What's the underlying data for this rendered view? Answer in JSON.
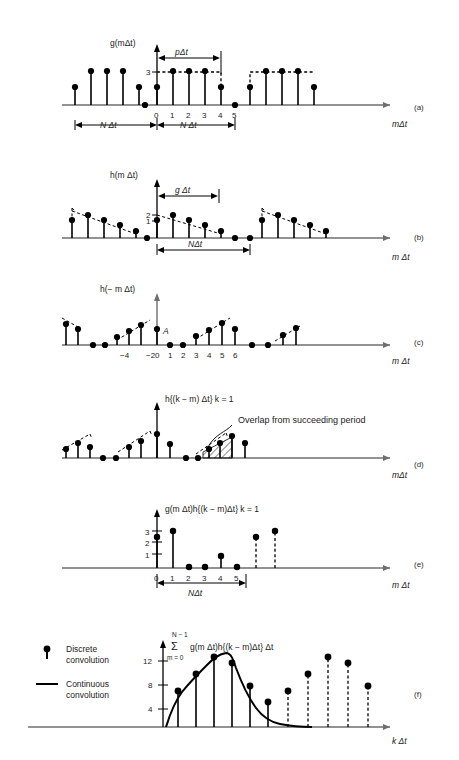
{
  "figure": {
    "title_implied": "Discrete convolution of periodic sequences",
    "panel_labels": [
      "(a)",
      "(b)",
      "(c)",
      "(d)",
      "(e)",
      "(f)"
    ],
    "colors": {
      "ink": "#000000",
      "axis": "#6e6e6e",
      "background": "#ffffff"
    }
  },
  "panels": {
    "a": {
      "label": "(a)",
      "function_label": "g(mΔt)",
      "x_axis_label": "mΔt",
      "y_ticks": [
        "3"
      ],
      "x_ticks": [
        "0",
        "1",
        "2",
        "3",
        "4",
        "5"
      ],
      "brackets": [
        "pΔt",
        "N Δt",
        "N Δt"
      ],
      "series_values": [
        1,
        3,
        3,
        3,
        1,
        0
      ],
      "series_x": [
        0,
        1,
        2,
        3,
        4,
        5
      ]
    },
    "b": {
      "label": "(b)",
      "function_label": "h(m Δt)",
      "x_axis_label": "m Δt",
      "y_ticks": [
        "2",
        "1"
      ],
      "brackets": [
        "g Δt",
        "NΔt"
      ],
      "series_values": [
        2,
        1.75,
        1.45,
        1.15,
        0.85,
        0.5,
        0.15,
        0,
        0
      ],
      "series_x": [
        0,
        1,
        2,
        3,
        4,
        5,
        6,
        7,
        8
      ]
    },
    "c": {
      "label": "(c)",
      "function_label": "h(− m Δt)",
      "x_axis_label": "m Δt",
      "point_label": "A",
      "x_ticks": [
        "−4",
        "−2",
        "0",
        "1",
        "2",
        "3",
        "4",
        "5",
        "6"
      ],
      "series_values": [
        0,
        0,
        0.35,
        0.7,
        1.05,
        1.4,
        1.75,
        2.0,
        0.15,
        0
      ],
      "series_x": [
        -5,
        -4,
        -3,
        -2,
        -1,
        0,
        1,
        2,
        3,
        4
      ]
    },
    "d": {
      "label": "(d)",
      "function_label": "h{(k − m) Δt} k = 1",
      "x_axis_label": "mΔt",
      "annotation": "Overlap from succeeding period",
      "series_values": [
        0.4,
        0.75,
        1.1,
        1.45,
        1.8,
        2.1,
        0.9,
        0
      ],
      "series_x": [
        0,
        1,
        2,
        3,
        4,
        5,
        6,
        7
      ]
    },
    "e": {
      "label": "(e)",
      "function_label": "g(m Δt)h{(k − m)Δt} k = 1",
      "x_axis_label": "m Δt",
      "y_ticks": [
        "3",
        "2",
        "1"
      ],
      "x_ticks": [
        "0",
        "1",
        "2",
        "3",
        "4",
        "5"
      ],
      "brackets": [
        "NΔt"
      ],
      "series_values": [
        2.2,
        3.0,
        0.12,
        0.12,
        0.95,
        0.1
      ],
      "series_x": [
        0,
        1,
        2,
        3,
        4,
        5
      ],
      "repeat_values": [
        2.2,
        3.0
      ]
    },
    "f": {
      "label": "(f)",
      "function_label_sum": "Σ",
      "function_label_upper": "N − 1",
      "function_label_lower": "m = 0",
      "function_label_body": "g(m Δt)h{(k − m)Δt} Δt",
      "x_axis_label": "k Δt",
      "y_ticks": [
        "12",
        "8",
        "4"
      ],
      "legend": [
        {
          "marker": "discrete-stem",
          "text_line1": "Discrete",
          "text_line2": "convolution"
        },
        {
          "marker": "continuous-line",
          "text_line1": "Continuous",
          "text_line2": "convolution"
        }
      ],
      "discrete_values": [
        6.0,
        8.8,
        11.5,
        10.5,
        6.9,
        4.3
      ],
      "repeat_values": [
        6.0,
        8.8,
        11.5,
        10.5,
        6.9
      ],
      "continuous_peak": 12.4
    }
  }
}
